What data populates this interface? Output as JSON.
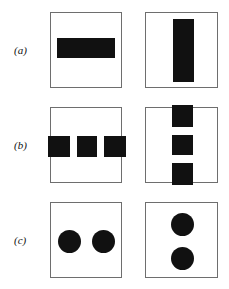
{
  "figure": {
    "background_color": "#ffffff",
    "ink_color": "#111111",
    "panel_border_color": "#6e6e6e",
    "rows": [
      {
        "label": "(a)",
        "panels": [
          {
            "position": "left",
            "shape_kind": "rectangle",
            "orientation": "horizontal",
            "shape_count": 1,
            "description": "single wide horizontal black bar centered"
          },
          {
            "position": "right",
            "shape_kind": "rectangle",
            "orientation": "vertical",
            "shape_count": 1,
            "description": "single tall vertical black bar centered"
          }
        ]
      },
      {
        "label": "(b)",
        "panels": [
          {
            "position": "left",
            "shape_kind": "square",
            "orientation": "horizontal",
            "shape_count": 3,
            "description": "three black squares in a horizontal row, outer two clipped by frame"
          },
          {
            "position": "right",
            "shape_kind": "square",
            "orientation": "vertical",
            "shape_count": 3,
            "description": "three black squares stacked vertically, top and bottom clipped by frame"
          }
        ]
      },
      {
        "label": "(c)",
        "panels": [
          {
            "position": "left",
            "shape_kind": "circle",
            "orientation": "horizontal",
            "shape_count": 2,
            "description": "two black circles side by side"
          },
          {
            "position": "right",
            "shape_kind": "circle",
            "orientation": "vertical",
            "shape_count": 2,
            "description": "two black circles stacked vertically"
          }
        ]
      }
    ]
  }
}
